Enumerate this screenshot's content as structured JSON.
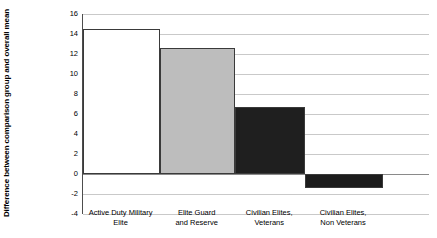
{
  "chart_data": {
    "type": "bar",
    "title": "",
    "xlabel": "",
    "ylabel": "Difference between comparison group and overall mean",
    "categories": [
      "Active Duty Military Elite",
      "Elite Guard and Reserve",
      "Civilian Elites, Veterans",
      "Civilian Elites, Non Veterans"
    ],
    "category_lines": [
      [
        "Active Duty Military",
        "Elite"
      ],
      [
        "Elite Guard",
        "and Reserve"
      ],
      [
        "Civilian Elites,",
        "Veterans"
      ],
      [
        "Civilian Elites,",
        "Non Veterans"
      ]
    ],
    "values": [
      14.5,
      12.6,
      6.7,
      -1.4
    ],
    "ylim": [
      -4,
      16
    ],
    "yticks": [
      16,
      14,
      12,
      10,
      8,
      6,
      4,
      2,
      0,
      -2,
      -4
    ],
    "ytick_labels": [
      "16",
      "14",
      "12",
      "10",
      "8",
      "6",
      "4",
      "2",
      "0",
      "-2",
      "-4"
    ],
    "grid": true,
    "legend": "none",
    "bar_colors": [
      "#ffffff",
      "#bdbdbd",
      "#1f1f1f",
      "#1c1c1c"
    ],
    "bar_border_color": "#3a3a3a",
    "gridline_color": "#c9c9c9",
    "axis_color": "#4d4d4d",
    "zero_line_color": "#8a8a8a",
    "bar_widths_pct": [
      22.3,
      21.7,
      20.2,
      22.5
    ]
  }
}
